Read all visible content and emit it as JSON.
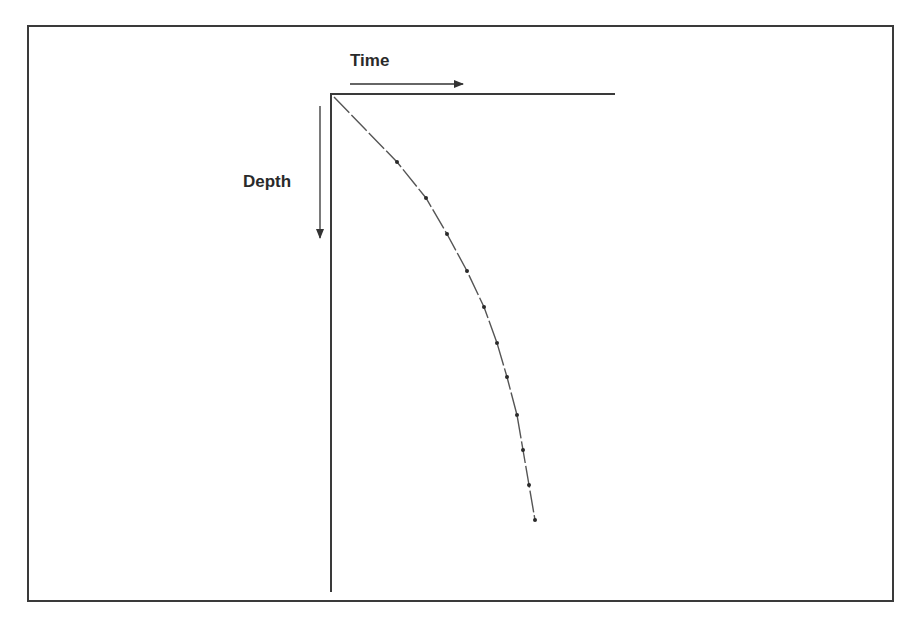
{
  "diagram": {
    "x_axis_label": "Time",
    "y_axis_label": "Depth",
    "colors": {
      "ink": "#3a3a3a",
      "curve": "#555555",
      "background": "#ffffff"
    }
  },
  "chart_data": {
    "type": "line",
    "title": "",
    "xlabel": "Time",
    "ylabel": "Depth",
    "points_px": [
      [
        334,
        97
      ],
      [
        397,
        162
      ],
      [
        426,
        198
      ],
      [
        447,
        234
      ],
      [
        467,
        271
      ],
      [
        484,
        307
      ],
      [
        497,
        343
      ],
      [
        507,
        377
      ],
      [
        517,
        415
      ],
      [
        523,
        450
      ],
      [
        529,
        485
      ],
      [
        535,
        520
      ]
    ],
    "axis_origin_px": [
      331,
      94
    ],
    "x_axis_end_px": [
      615,
      94
    ],
    "y_axis_end_px": [
      331,
      592
    ],
    "grid": false,
    "legend": false
  }
}
